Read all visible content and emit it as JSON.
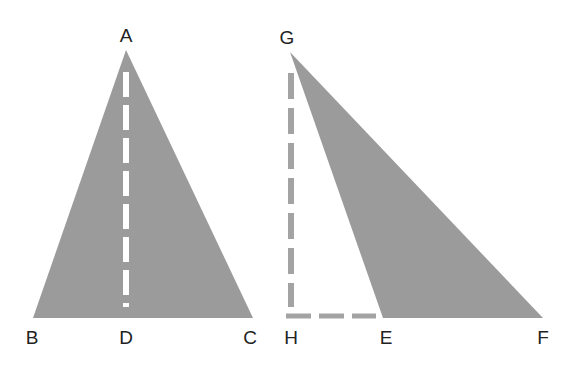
{
  "diagram": {
    "colors": {
      "fill": "#9b9b9b",
      "inner_dash": "#ffffff",
      "outer_dash": "#a3a3a3",
      "label": "#222222",
      "background": "#ffffff"
    },
    "figure_left": {
      "shape": "isosceles-triangle",
      "vertices": {
        "A": {
          "x": 126,
          "y": 50
        },
        "B": {
          "x": 33,
          "y": 318
        },
        "C": {
          "x": 253,
          "y": 318
        }
      },
      "altitude": {
        "from": "A",
        "to": "D",
        "style": "dashed-white",
        "foot": {
          "x": 126,
          "y": 318
        }
      },
      "labels": [
        {
          "text": "A",
          "x": 126,
          "y": 35
        },
        {
          "text": "B",
          "x": 32,
          "y": 337
        },
        {
          "text": "D",
          "x": 126,
          "y": 337
        },
        {
          "text": "C",
          "x": 250,
          "y": 337
        }
      ]
    },
    "figure_right": {
      "shape": "obtuse-triangle",
      "vertices": {
        "G": {
          "x": 290,
          "y": 52
        },
        "E": {
          "x": 383,
          "y": 318
        },
        "F": {
          "x": 543,
          "y": 318
        }
      },
      "altitude": {
        "from": "G",
        "to": "H",
        "style": "dashed-gray",
        "foot": {
          "x": 290,
          "y": 318
        }
      },
      "extension": {
        "from": "H",
        "to": "E",
        "style": "dashed-gray"
      },
      "labels": [
        {
          "text": "G",
          "x": 287,
          "y": 37
        },
        {
          "text": "H",
          "x": 291,
          "y": 337
        },
        {
          "text": "E",
          "x": 386,
          "y": 337
        },
        {
          "text": "F",
          "x": 543,
          "y": 337
        }
      ]
    }
  }
}
